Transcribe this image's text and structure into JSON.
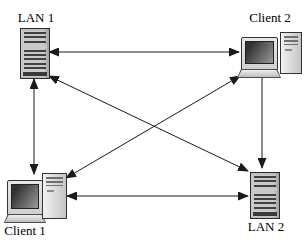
{
  "window": {
    "width": 306,
    "height": 240,
    "background": "#ffffff"
  },
  "diagram": {
    "type": "network-topology",
    "colors": {
      "background": "#ffffff",
      "arrow": "#1a1a1a",
      "label_text": "#000000",
      "icon_body": "#c9c9c9",
      "icon_stripe": "#404040"
    },
    "nodes": [
      {
        "id": "lan1",
        "label": "LAN 1",
        "icon": "server",
        "position": "top-left",
        "label_placement": "above"
      },
      {
        "id": "client2",
        "label": "Client 2",
        "icon": "desktop-computer",
        "position": "top-right",
        "label_placement": "above"
      },
      {
        "id": "client1",
        "label": "Client 1",
        "icon": "desktop-computer",
        "position": "bottom-left",
        "label_placement": "below"
      },
      {
        "id": "lan2",
        "label": "LAN 2",
        "icon": "server",
        "position": "bottom-right",
        "label_placement": "below"
      }
    ],
    "links": [
      {
        "from": "lan1",
        "to": "client2",
        "arrows": "both"
      },
      {
        "from": "lan1",
        "to": "client1",
        "arrows": "both"
      },
      {
        "from": "client2",
        "to": "lan2",
        "arrows": "to"
      },
      {
        "from": "client1",
        "to": "lan2",
        "arrows": "both"
      },
      {
        "from": "lan1",
        "to": "lan2",
        "arrows": "both"
      },
      {
        "from": "client1",
        "to": "client2",
        "arrows": "both"
      }
    ]
  }
}
